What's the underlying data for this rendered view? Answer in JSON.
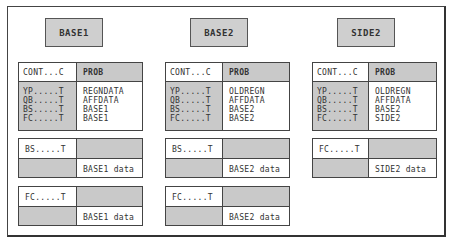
{
  "columns": [
    {
      "title": "BASE1",
      "header": {
        "left": "CONT...C",
        "right": "PROB"
      },
      "rows": [
        {
          "key": "YP.....T",
          "value": "REGNDATA"
        },
        {
          "key": "QB.....T",
          "value": "AFFDATA"
        },
        {
          "key": "BS.....T",
          "value": "BASE1"
        },
        {
          "key": "FC.....T",
          "value": "BASE1"
        }
      ],
      "subtables": [
        {
          "key": "BS.....T",
          "data": "BASE1 data"
        },
        {
          "key": "FC.....T",
          "data": "BASE1 data"
        }
      ]
    },
    {
      "title": "BASE2",
      "header": {
        "left": "CONT...C",
        "right": "PROB"
      },
      "rows": [
        {
          "key": "YP.....T",
          "value": "OLDREGN"
        },
        {
          "key": "QB.....T",
          "value": "AFFDATA"
        },
        {
          "key": "BS.....T",
          "value": "BASE2"
        },
        {
          "key": "FC.....T",
          "value": "BASE2"
        }
      ],
      "subtables": [
        {
          "key": "BS.....T",
          "data": "BASE2 data"
        },
        {
          "key": "FC.....T",
          "data": "BASE2 data"
        }
      ]
    },
    {
      "title": "SIDE2",
      "header": {
        "left": "CONT...C",
        "right": "PROB"
      },
      "rows": [
        {
          "key": "YP.....T",
          "value": "OLDREGN"
        },
        {
          "key": "QB.....T",
          "value": "AFFDATA"
        },
        {
          "key": "BS.....T",
          "value": "BASE2"
        },
        {
          "key": "FC.....T",
          "value": "SIDE2"
        }
      ],
      "subtables": [
        {
          "key": "FC.....T",
          "data": "SIDE2 data"
        }
      ]
    }
  ],
  "colors": {
    "fill_gray": "#c9c9c9",
    "border": "#444444",
    "background": "#ffffff"
  }
}
